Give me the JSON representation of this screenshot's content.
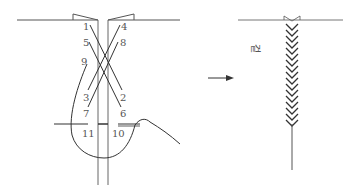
{
  "diagram": {
    "left": {
      "name": "stitch-steps",
      "labels": [
        {
          "text": "1",
          "x": 83,
          "y": 30
        },
        {
          "text": "4",
          "x": 121,
          "y": 30
        },
        {
          "text": "5",
          "x": 83,
          "y": 46
        },
        {
          "text": "8",
          "x": 120,
          "y": 46
        },
        {
          "text": "9",
          "x": 81,
          "y": 65
        },
        {
          "text": "3",
          "x": 83,
          "y": 101
        },
        {
          "text": "2",
          "x": 120,
          "y": 101
        },
        {
          "text": "7",
          "x": 83,
          "y": 117
        },
        {
          "text": "6",
          "x": 120,
          "y": 117
        },
        {
          "text": "11",
          "x": 82,
          "y": 137
        },
        {
          "text": "10",
          "x": 112,
          "y": 137
        }
      ]
    },
    "arrow": {
      "direction": "right"
    },
    "right": {
      "name": "finished-seam",
      "side_label": "겉"
    },
    "colors": {
      "line": "#333333",
      "label": "#555555",
      "background": "#ffffff"
    }
  }
}
